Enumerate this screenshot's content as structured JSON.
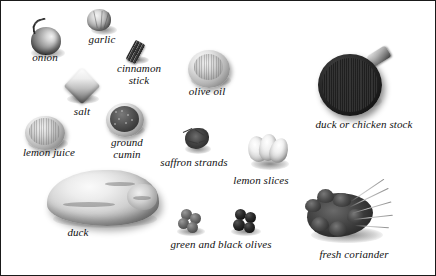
{
  "image": {
    "kind": "ingredients-photo-plate",
    "background_color": "#ffffff",
    "border_color": "#1a1a1a",
    "label_color": "#111111",
    "width": 436,
    "height": 276
  },
  "labels": [
    {
      "id": "onion",
      "text": "onion",
      "left": 22,
      "top": 51,
      "width": 44
    },
    {
      "id": "garlic",
      "text": "garlic",
      "left": 78,
      "top": 33,
      "width": 46
    },
    {
      "id": "cinnamon",
      "text": "cinnamon\nstick",
      "left": 107,
      "top": 62,
      "width": 62
    },
    {
      "id": "salt",
      "text": "salt",
      "left": 62,
      "top": 105,
      "width": 38
    },
    {
      "id": "olive-oil",
      "text": "olive oil",
      "left": 178,
      "top": 85,
      "width": 56
    },
    {
      "id": "stock",
      "text": "duck or chicken stock",
      "left": 301,
      "top": 118,
      "width": 124
    },
    {
      "id": "lemon-juice",
      "text": "lemon juice",
      "left": 10,
      "top": 146,
      "width": 76
    },
    {
      "id": "cumin",
      "text": "ground\ncumin",
      "left": 100,
      "top": 136,
      "width": 52
    },
    {
      "id": "saffron",
      "text": "saffron strands",
      "left": 151,
      "top": 156,
      "width": 84
    },
    {
      "id": "lemon-slices",
      "text": "lemon slices",
      "left": 223,
      "top": 174,
      "width": 74
    },
    {
      "id": "duck",
      "text": "duck",
      "left": 56,
      "top": 226,
      "width": 42
    },
    {
      "id": "olives",
      "text": "green and black olives",
      "left": 156,
      "top": 238,
      "width": 128
    },
    {
      "id": "coriander",
      "text": "fresh coriander",
      "left": 308,
      "top": 248,
      "width": 90
    }
  ],
  "items": [
    {
      "id": "onion",
      "name": "onion",
      "left": 24,
      "top": 18
    },
    {
      "id": "garlic",
      "name": "garlic",
      "left": 86,
      "top": 8
    },
    {
      "id": "cinnamon-stick",
      "name": "cinnamon-stick",
      "left": 124,
      "top": 38
    },
    {
      "id": "salt",
      "name": "salt",
      "left": 62,
      "top": 69
    },
    {
      "id": "olive-oil",
      "name": "olive-oil-bowl",
      "left": 185,
      "top": 48
    },
    {
      "id": "lemon-juice",
      "name": "lemon-juice-bowl",
      "left": 22,
      "top": 114
    },
    {
      "id": "ground-cumin",
      "name": "ground-cumin-bowl",
      "left": 103,
      "top": 101
    },
    {
      "id": "saffron-strands",
      "name": "saffron-strands",
      "left": 178,
      "top": 123
    },
    {
      "id": "stock-pan",
      "name": "duck-or-chicken-stock",
      "left": 315,
      "top": 47
    },
    {
      "id": "duck",
      "name": "duck",
      "left": 44,
      "top": 167
    },
    {
      "id": "lemon-slices",
      "name": "lemon-slices",
      "left": 245,
      "top": 131
    },
    {
      "id": "olives",
      "name": "green-and-black-olives",
      "left": 172,
      "top": 206
    },
    {
      "id": "coriander",
      "name": "fresh-coriander",
      "left": 300,
      "top": 178
    }
  ]
}
